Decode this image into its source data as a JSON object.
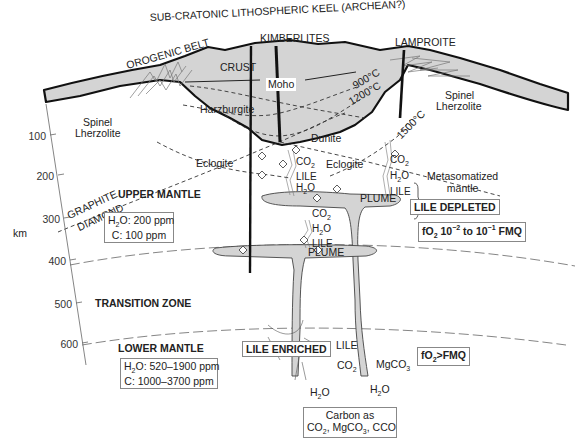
{
  "title": "SUB-CRATONIC LITHOSPHERIC KEEL (ARCHEAN?)",
  "top_labels": {
    "orogenic_belt": "OROGENIC BELT",
    "kimberlites": "KIMBERLITES",
    "lamproite": "LAMPROITE"
  },
  "lithosphere_labels": {
    "crust": "CRUST",
    "moho": "Moho",
    "harzburgite": "Harzburgite",
    "dunite": "Dunite",
    "spinel_left": "Spinel",
    "lherzolite_left": "Lherzolite",
    "spinel_right": "Spinel",
    "lherzolite_right": "Lherzolite",
    "eclogite_left": "Eclogite",
    "eclogite_right": "Eclogite"
  },
  "isotherms": [
    "900°C",
    "1200°C",
    "1500°C"
  ],
  "phase_boundary": {
    "upper": "GRAPHITE",
    "lower": "DIAMOND"
  },
  "depth_axis": {
    "unit": "km",
    "ticks": [
      "100",
      "200",
      "300",
      "400",
      "500",
      "600"
    ]
  },
  "zones": {
    "upper_mantle": "UPPER MANTLE",
    "transition_zone": "TRANSITION ZONE",
    "lower_mantle": "LOWER MANTLE"
  },
  "upper_mantle_box": {
    "line1_pre": "H",
    "line1_sub": "2",
    "line1_post": "O: 200 ppm",
    "line2": "C: 100 ppm"
  },
  "lower_mantle_box": {
    "line1_pre": "H",
    "line1_sub": "2",
    "line1_post": "O: 520–1900 ppm",
    "line2": "C: 1000–3700 ppm"
  },
  "fluids": {
    "co2": "CO",
    "co2_sub": "2",
    "h2o_pre": "H",
    "h2o_sub": "2",
    "h2o_post": "O",
    "lile": "LILE",
    "mgco3_pre": "MgCO",
    "mgco3_sub": "3"
  },
  "plume": "PLUME",
  "metasomatized": {
    "line1": "Metasomatized",
    "line2": "mantle"
  },
  "lile_depleted": "LILE DEPLETED",
  "lile_enriched": "LILE ENRICHED",
  "fo2_upper": {
    "pre": "fO",
    "sub": "2",
    "mid1": " 10",
    "sup1": "−2",
    "mid2": " to 10",
    "sup2": "−1",
    "post": " FMQ"
  },
  "fo2_lower": {
    "pre": "fO",
    "sub": "2",
    "post": ">FMQ"
  },
  "carbon_box": {
    "line1": "Carbon as",
    "line2_a": "CO",
    "line2_sub1": "2",
    "line2_b": ", MgCO",
    "line2_sub2": "3",
    "line2_c": ", CCO"
  },
  "colors": {
    "lithosphere_fill": "#d4d4d4",
    "line": "#111111",
    "dash": "#444444",
    "background": "#ffffff"
  }
}
